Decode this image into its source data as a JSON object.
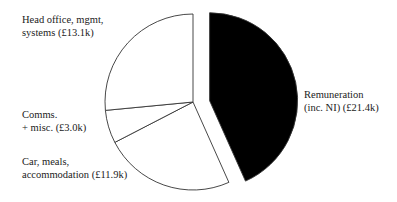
{
  "chart_data": {
    "type": "pie",
    "title": "",
    "unit": "£k",
    "start_angle_deg": 0,
    "direction": "clockwise",
    "slices": [
      {
        "label_line1": "Remuneration",
        "label_line2": "(inc. NI) (£21.4k)",
        "name": "Remuneration (inc. NI)",
        "value": 21.4,
        "color": "#000000",
        "exploded": true
      },
      {
        "label_line1": "Car, meals,",
        "label_line2": "accommodation (£11.9k)",
        "name": "Car, meals, accommodation",
        "value": 11.9,
        "color": "#ffffff",
        "exploded": false
      },
      {
        "label_line1": "Comms.",
        "label_line2": "+ misc. (£3.0k)",
        "name": "Comms. + misc.",
        "value": 3.0,
        "color": "#ffffff",
        "exploded": false
      },
      {
        "label_line1": "Head office, mgmt,",
        "label_line2": "systems (£13.1k)",
        "name": "Head office, mgmt, systems",
        "value": 13.1,
        "color": "#ffffff",
        "exploded": false
      }
    ],
    "legend": "none (direct labels)"
  }
}
